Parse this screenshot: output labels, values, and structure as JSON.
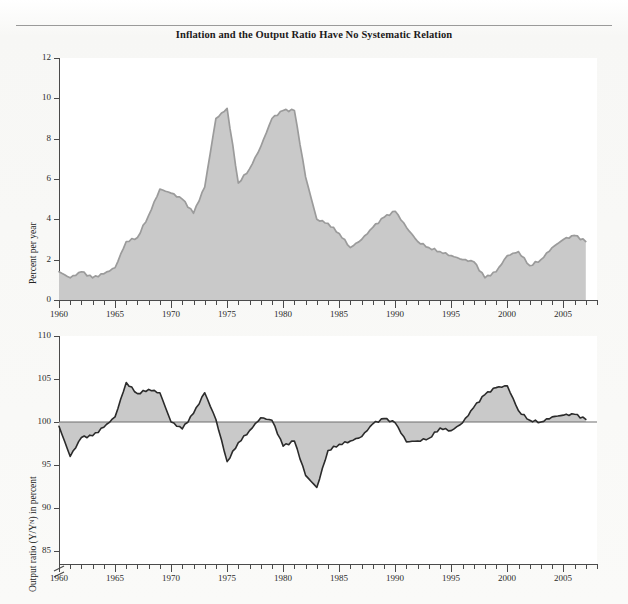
{
  "page": {
    "running_head": "",
    "title": "Inflation and the Output Ratio Have No Systematic Relation"
  },
  "chart_data": [
    {
      "type": "area",
      "name": "inflation-panel",
      "title": "Inflation and the Output Ratio Have No Systematic Relation",
      "xlabel": "",
      "ylabel": "Percent per year",
      "series_label": "Inflation rate",
      "xlim": [
        1960,
        2008
      ],
      "ylim": [
        0,
        12
      ],
      "yticks": [
        0,
        2,
        4,
        6,
        8,
        10,
        12
      ],
      "xticks_major": [
        1960,
        1965,
        1970,
        1975,
        1980,
        1985,
        1990,
        1995,
        2000,
        2005
      ],
      "xtick_interval_minor": 1,
      "grid": false,
      "fill_color": "#c9c9c9",
      "line_color": "#9b9b9b",
      "x": [
        1960,
        1961,
        1962,
        1963,
        1964,
        1965,
        1966,
        1967,
        1968,
        1969,
        1970,
        1971,
        1972,
        1973,
        1974,
        1975,
        1976,
        1977,
        1978,
        1979,
        1980,
        1981,
        1982,
        1983,
        1984,
        1985,
        1986,
        1987,
        1988,
        1989,
        1990,
        1991,
        1992,
        1993,
        1994,
        1995,
        1996,
        1997,
        1998,
        1999,
        2000,
        2001,
        2002,
        2003,
        2004,
        2005,
        2006,
        2007
      ],
      "values": [
        1.4,
        1.1,
        1.4,
        1.1,
        1.3,
        1.6,
        2.9,
        3.1,
        4.2,
        5.5,
        5.3,
        5.0,
        4.3,
        5.6,
        9.0,
        9.5,
        5.8,
        6.5,
        7.6,
        9.0,
        9.4,
        9.4,
        6.1,
        4.0,
        3.8,
        3.3,
        2.6,
        3.0,
        3.6,
        4.1,
        4.4,
        3.6,
        2.9,
        2.6,
        2.4,
        2.2,
        2.0,
        1.9,
        1.1,
        1.4,
        2.2,
        2.4,
        1.7,
        2.0,
        2.6,
        3.0,
        3.2,
        2.9
      ],
      "annotations": [
        {
          "text": "Inflation rate",
          "x": 1983.5,
          "y": 8.4
        }
      ]
    },
    {
      "type": "area",
      "name": "output-ratio-panel",
      "xlabel": "",
      "ylabel": "Output ratio (Y/Yᴺ) in percent",
      "series_label": "Output ratio",
      "xlim": [
        1960,
        2008
      ],
      "ylim": [
        83.5,
        110
      ],
      "yticks": [
        85,
        90,
        95,
        100,
        105,
        110
      ],
      "xticks_major": [
        1960,
        1965,
        1970,
        1975,
        1980,
        1985,
        1990,
        1995,
        2000,
        2005
      ],
      "xtick_interval_minor": 1,
      "axis_break": true,
      "reference_line": 100,
      "grid": false,
      "fill_color": "#c9c9c9",
      "line_color": "#2b2b2b",
      "x": [
        1960,
        1961,
        1962,
        1963,
        1964,
        1965,
        1966,
        1967,
        1968,
        1969,
        1970,
        1971,
        1972,
        1973,
        1974,
        1975,
        1976,
        1977,
        1978,
        1979,
        1980,
        1981,
        1982,
        1983,
        1984,
        1985,
        1986,
        1987,
        1988,
        1989,
        1990,
        1991,
        1992,
        1993,
        1994,
        1995,
        1996,
        1997,
        1998,
        1999,
        2000,
        2001,
        2002,
        2003,
        2004,
        2005,
        2006,
        2007
      ],
      "values": [
        99.5,
        96.0,
        98.2,
        98.4,
        99.4,
        100.6,
        104.6,
        103.3,
        103.8,
        103.4,
        100.0,
        99.2,
        101.0,
        103.4,
        100.3,
        95.4,
        97.6,
        99.0,
        100.5,
        100.2,
        97.2,
        97.8,
        93.8,
        92.4,
        96.7,
        97.4,
        97.8,
        98.3,
        99.8,
        100.4,
        99.9,
        97.7,
        97.8,
        98.1,
        99.3,
        99.0,
        99.9,
        101.7,
        103.2,
        104.0,
        104.2,
        101.3,
        100.2,
        100.0,
        100.6,
        100.8,
        100.9,
        100.3
      ],
      "annotations": [
        {
          "text": "Output ratio",
          "x": 1983.0,
          "y": 93.0
        }
      ]
    }
  ]
}
